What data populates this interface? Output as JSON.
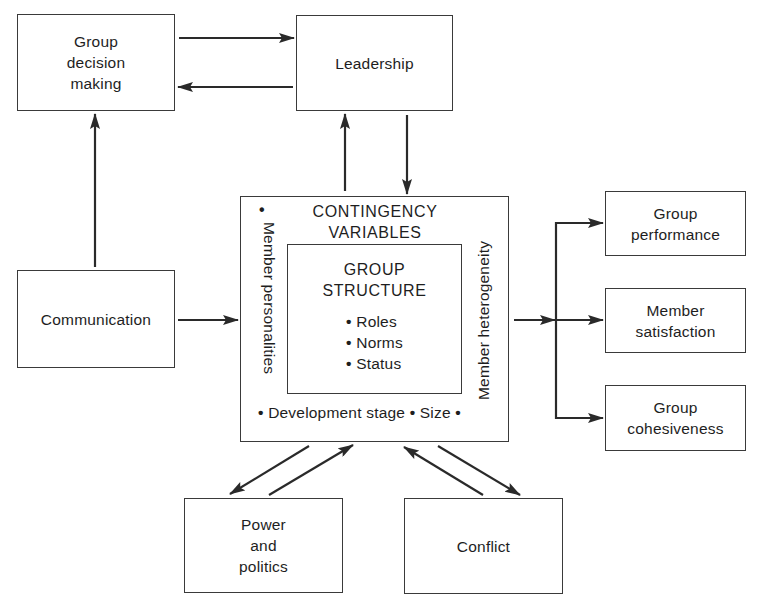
{
  "diagram": {
    "type": "flow",
    "nodes": {
      "group_decision_making": {
        "lines": [
          "Group",
          "decision",
          "making"
        ]
      },
      "leadership": {
        "label": "Leadership"
      },
      "communication": {
        "label": "Communication"
      },
      "contingency_variables": {
        "title_lines": [
          "CONTINGENCY",
          "VARIABLES"
        ],
        "left_variable": "Member personalities",
        "right_variable": "Member heterogeneity",
        "bottom_variables": [
          "Development stage",
          "Size"
        ],
        "bullet": "•"
      },
      "group_structure": {
        "title_lines": [
          "GROUP",
          "STRUCTURE"
        ],
        "items": [
          "Roles",
          "Norms",
          "Status"
        ],
        "bullet": "•"
      },
      "group_performance": {
        "lines": [
          "Group",
          "performance"
        ]
      },
      "member_satisfaction": {
        "lines": [
          "Member",
          "satisfaction"
        ]
      },
      "group_cohesiveness": {
        "lines": [
          "Group",
          "cohesiveness"
        ]
      },
      "power_and_politics": {
        "lines": [
          "Power",
          "and",
          "politics"
        ]
      },
      "conflict": {
        "label": "Conflict"
      }
    },
    "edges": [
      {
        "from": "Group decision making",
        "to": "Leadership"
      },
      {
        "from": "Leadership",
        "to": "Group decision making"
      },
      {
        "from": "Communication",
        "to": "Group decision making"
      },
      {
        "from": "Communication",
        "to": "Contingency variables"
      },
      {
        "from": "Contingency variables",
        "to": "Leadership"
      },
      {
        "from": "Leadership",
        "to": "Contingency variables"
      },
      {
        "from": "Contingency variables",
        "to": "Group performance"
      },
      {
        "from": "Contingency variables",
        "to": "Member satisfaction"
      },
      {
        "from": "Contingency variables",
        "to": "Group cohesiveness"
      },
      {
        "from": "Contingency variables",
        "to": "Power and politics"
      },
      {
        "from": "Power and politics",
        "to": "Contingency variables"
      },
      {
        "from": "Conflict",
        "to": "Contingency variables"
      },
      {
        "from": "Contingency variables",
        "to": "Conflict"
      }
    ],
    "colors": {
      "line": "#2a2a2a",
      "background": "#ffffff",
      "text": "#1e1e1e"
    }
  }
}
